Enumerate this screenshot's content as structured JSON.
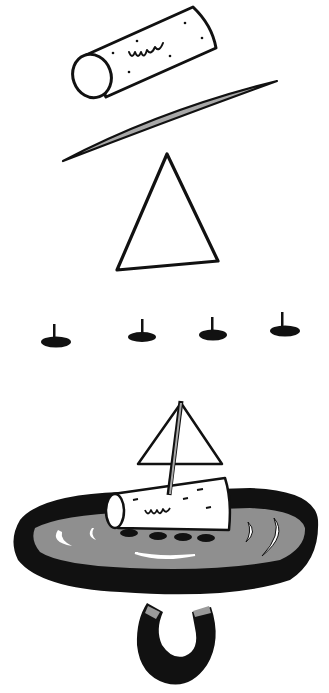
{
  "illustration": {
    "subject": "cork sailboat magnet experiment",
    "colors": {
      "ink": "#111111",
      "paper": "#ffffff",
      "water": "#8f8f8f",
      "gray_fill": "#a8a8a8",
      "magnet_tip": "#9a9a9a"
    },
    "items": [
      {
        "name": "cork",
        "count": 1
      },
      {
        "name": "toothpick",
        "count": 1
      },
      {
        "name": "paper-sail",
        "count": 1
      },
      {
        "name": "thumbtack",
        "count": 4
      },
      {
        "name": "assembled-boat-in-dish",
        "count": 1
      },
      {
        "name": "horseshoe-magnet",
        "count": 1
      }
    ]
  }
}
